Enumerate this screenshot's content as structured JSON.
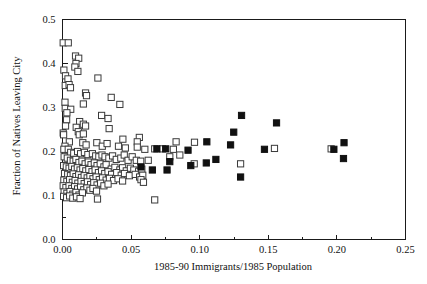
{
  "chart_data": {
    "type": "scatter",
    "title": "",
    "subtitle": "",
    "xlabel": "1985-90 Immigrants/1985 Population",
    "ylabel": "Fraction of Natives Leaving City",
    "xlim": [
      0.0,
      0.25
    ],
    "ylim": [
      0.0,
      0.5
    ],
    "xticks": [
      0.0,
      0.05,
      0.1,
      0.15,
      0.2,
      0.25
    ],
    "xticklabels": [
      "0.00",
      "0.05",
      "0.10",
      "0.15",
      "0.20",
      "0.25"
    ],
    "yticks": [
      0.0,
      0.1,
      0.2,
      0.3,
      0.4,
      0.5
    ],
    "yticklabels": [
      "0.0",
      "0.1",
      "0.2",
      "0.3",
      "0.4",
      "0.5"
    ],
    "x_minor_ticks": [
      0.025,
      0.075,
      0.125,
      0.175,
      0.225
    ],
    "y_minor_ticks": [
      0.05,
      0.15,
      0.25,
      0.35,
      0.45
    ],
    "grid": false,
    "legend": null,
    "legend_position": "none",
    "marker_size_px": 6.2,
    "series": [
      {
        "name": "open-squares",
        "marker": "open-square",
        "fill": "#ffffff",
        "edge": "#3a3a3a",
        "points": [
          [
            0.0005,
            0.447
          ],
          [
            0.0042,
            0.447
          ],
          [
            0.001,
            0.385
          ],
          [
            0.0095,
            0.417
          ],
          [
            0.0118,
            0.412
          ],
          [
            0.0098,
            0.4
          ],
          [
            0.009,
            0.392
          ],
          [
            0.0112,
            0.382
          ],
          [
            0.0022,
            0.372
          ],
          [
            0.004,
            0.365
          ],
          [
            0.0258,
            0.367
          ],
          [
            0.002,
            0.35
          ],
          [
            0.0048,
            0.352
          ],
          [
            0.0058,
            0.345
          ],
          [
            0.0168,
            0.333
          ],
          [
            0.0175,
            0.327
          ],
          [
            0.0355,
            0.323
          ],
          [
            0.0152,
            0.308
          ],
          [
            0.0018,
            0.312
          ],
          [
            0.0418,
            0.307
          ],
          [
            0.002,
            0.298
          ],
          [
            0.006,
            0.296
          ],
          [
            0.0032,
            0.288
          ],
          [
            0.0285,
            0.282
          ],
          [
            0.0332,
            0.275
          ],
          [
            0.003,
            0.272
          ],
          [
            0.0125,
            0.268
          ],
          [
            0.0152,
            0.262
          ],
          [
            0.0168,
            0.258
          ],
          [
            0.0022,
            0.258
          ],
          [
            0.01,
            0.255
          ],
          [
            0.034,
            0.252
          ],
          [
            0.0005,
            0.242
          ],
          [
            0.0008,
            0.238
          ],
          [
            0.0115,
            0.245
          ],
          [
            0.0122,
            0.238
          ],
          [
            0.0152,
            0.24
          ],
          [
            0.044,
            0.228
          ],
          [
            0.056,
            0.232
          ],
          [
            0.0545,
            0.222
          ],
          [
            0.0828,
            0.222
          ],
          [
            0.0962,
            0.221
          ],
          [
            0.005,
            0.222
          ],
          [
            0.0148,
            0.22
          ],
          [
            0.0172,
            0.215
          ],
          [
            0.025,
            0.22
          ],
          [
            0.0018,
            0.212
          ],
          [
            0.029,
            0.212
          ],
          [
            0.0325,
            0.218
          ],
          [
            0.0408,
            0.212
          ],
          [
            0.0458,
            0.208
          ],
          [
            0.0545,
            0.21
          ],
          [
            0.06,
            0.205
          ],
          [
            0.0672,
            0.206
          ],
          [
            0.0728,
            0.206
          ],
          [
            0.0808,
            0.205
          ],
          [
            0.1545,
            0.207
          ],
          [
            0.1958,
            0.206
          ],
          [
            0.001,
            0.205
          ],
          [
            0.0042,
            0.205
          ],
          [
            0.006,
            0.198
          ],
          [
            0.0082,
            0.196
          ],
          [
            0.011,
            0.2
          ],
          [
            0.0132,
            0.195
          ],
          [
            0.016,
            0.198
          ],
          [
            0.0185,
            0.193
          ],
          [
            0.0218,
            0.195
          ],
          [
            0.0242,
            0.19
          ],
          [
            0.0265,
            0.188
          ],
          [
            0.0288,
            0.192
          ],
          [
            0.031,
            0.188
          ],
          [
            0.0338,
            0.185
          ],
          [
            0.0365,
            0.19
          ],
          [
            0.0392,
            0.182
          ],
          [
            0.0425,
            0.185
          ],
          [
            0.045,
            0.192
          ],
          [
            0.0478,
            0.18
          ],
          [
            0.0508,
            0.188
          ],
          [
            0.0538,
            0.18
          ],
          [
            0.057,
            0.178
          ],
          [
            0.0625,
            0.18
          ],
          [
            0.0782,
            0.188
          ],
          [
            0.0855,
            0.192
          ],
          [
            0.096,
            0.172
          ],
          [
            0.1298,
            0.172
          ],
          [
            0.0012,
            0.188
          ],
          [
            0.0035,
            0.185
          ],
          [
            0.0058,
            0.18
          ],
          [
            0.0078,
            0.178
          ],
          [
            0.0098,
            0.182
          ],
          [
            0.012,
            0.175
          ],
          [
            0.0142,
            0.178
          ],
          [
            0.0165,
            0.172
          ],
          [
            0.0188,
            0.176
          ],
          [
            0.0208,
            0.17
          ],
          [
            0.0232,
            0.174
          ],
          [
            0.0252,
            0.168
          ],
          [
            0.0275,
            0.172
          ],
          [
            0.0302,
            0.165
          ],
          [
            0.0318,
            0.17
          ],
          [
            0.0355,
            0.16
          ],
          [
            0.0382,
            0.164
          ],
          [
            0.0418,
            0.158
          ],
          [
            0.0438,
            0.163
          ],
          [
            0.0465,
            0.156
          ],
          [
            0.0495,
            0.162
          ],
          [
            0.052,
            0.158
          ],
          [
            0.0555,
            0.155
          ],
          [
            0.0578,
            0.16
          ],
          [
            0.0008,
            0.168
          ],
          [
            0.0028,
            0.165
          ],
          [
            0.0048,
            0.162
          ],
          [
            0.0068,
            0.166
          ],
          [
            0.0088,
            0.16
          ],
          [
            0.0108,
            0.163
          ],
          [
            0.0128,
            0.158
          ],
          [
            0.0148,
            0.161
          ],
          [
            0.017,
            0.156
          ],
          [
            0.0192,
            0.159
          ],
          [
            0.0215,
            0.154
          ],
          [
            0.0238,
            0.158
          ],
          [
            0.0262,
            0.152
          ],
          [
            0.0285,
            0.156
          ],
          [
            0.0308,
            0.15
          ],
          [
            0.0332,
            0.154
          ],
          [
            0.0358,
            0.148
          ],
          [
            0.0395,
            0.152
          ],
          [
            0.0428,
            0.146
          ],
          [
            0.0452,
            0.15
          ],
          [
            0.0488,
            0.145
          ],
          [
            0.053,
            0.148
          ],
          [
            0.0562,
            0.142
          ],
          [
            0.0585,
            0.146
          ],
          [
            0.0015,
            0.15
          ],
          [
            0.0038,
            0.148
          ],
          [
            0.0058,
            0.145
          ],
          [
            0.0078,
            0.149
          ],
          [
            0.0098,
            0.143
          ],
          [
            0.0118,
            0.147
          ],
          [
            0.0138,
            0.141
          ],
          [
            0.0158,
            0.145
          ],
          [
            0.018,
            0.14
          ],
          [
            0.02,
            0.143
          ],
          [
            0.0222,
            0.138
          ],
          [
            0.0245,
            0.142
          ],
          [
            0.0268,
            0.136
          ],
          [
            0.0292,
            0.14
          ],
          [
            0.0318,
            0.135
          ],
          [
            0.0342,
            0.139
          ],
          [
            0.0372,
            0.134
          ],
          [
            0.0405,
            0.138
          ],
          [
            0.0438,
            0.133
          ],
          [
            0.0572,
            0.136
          ],
          [
            0.059,
            0.13
          ],
          [
            0.001,
            0.135
          ],
          [
            0.0032,
            0.132
          ],
          [
            0.0052,
            0.136
          ],
          [
            0.0072,
            0.13
          ],
          [
            0.0092,
            0.134
          ],
          [
            0.0112,
            0.128
          ],
          [
            0.0135,
            0.132
          ],
          [
            0.0158,
            0.127
          ],
          [
            0.0182,
            0.131
          ],
          [
            0.0205,
            0.125
          ],
          [
            0.0228,
            0.129
          ],
          [
            0.0252,
            0.124
          ],
          [
            0.0278,
            0.128
          ],
          [
            0.0302,
            0.122
          ],
          [
            0.0332,
            0.126
          ],
          [
            0.0005,
            0.122
          ],
          [
            0.0025,
            0.118
          ],
          [
            0.0048,
            0.122
          ],
          [
            0.0068,
            0.116
          ],
          [
            0.0088,
            0.12
          ],
          [
            0.011,
            0.115
          ],
          [
            0.0132,
            0.119
          ],
          [
            0.0155,
            0.113
          ],
          [
            0.0178,
            0.117
          ],
          [
            0.02,
            0.112
          ],
          [
            0.0222,
            0.116
          ],
          [
            0.0248,
            0.11
          ],
          [
            0.0012,
            0.108
          ],
          [
            0.0032,
            0.105
          ],
          [
            0.0055,
            0.109
          ],
          [
            0.0075,
            0.103
          ],
          [
            0.0098,
            0.107
          ],
          [
            0.012,
            0.101
          ],
          [
            0.0145,
            0.106
          ],
          [
            0.0008,
            0.098
          ],
          [
            0.003,
            0.095
          ],
          [
            0.0052,
            0.099
          ],
          [
            0.0075,
            0.094
          ],
          [
            0.0102,
            0.097
          ],
          [
            0.0128,
            0.093
          ],
          [
            0.0255,
            0.092
          ],
          [
            0.0672,
            0.09
          ]
        ]
      },
      {
        "name": "filled-squares",
        "marker": "filled-square",
        "fill": "#111111",
        "edge": "#111111",
        "points": [
          [
            0.1305,
            0.282
          ],
          [
            0.156,
            0.265
          ],
          [
            0.1248,
            0.244
          ],
          [
            0.1052,
            0.222
          ],
          [
            0.1225,
            0.215
          ],
          [
            0.2052,
            0.22
          ],
          [
            0.0915,
            0.203
          ],
          [
            0.0688,
            0.206
          ],
          [
            0.0752,
            0.206
          ],
          [
            0.1472,
            0.205
          ],
          [
            0.1978,
            0.205
          ],
          [
            0.2048,
            0.184
          ],
          [
            0.1118,
            0.182
          ],
          [
            0.0782,
            0.177
          ],
          [
            0.1048,
            0.174
          ],
          [
            0.0935,
            0.168
          ],
          [
            0.0572,
            0.165
          ],
          [
            0.0655,
            0.158
          ],
          [
            0.0762,
            0.158
          ],
          [
            0.1298,
            0.142
          ]
        ]
      }
    ]
  },
  "axes": {
    "frame_color": "#1a1a1a",
    "background": "#ffffff"
  }
}
